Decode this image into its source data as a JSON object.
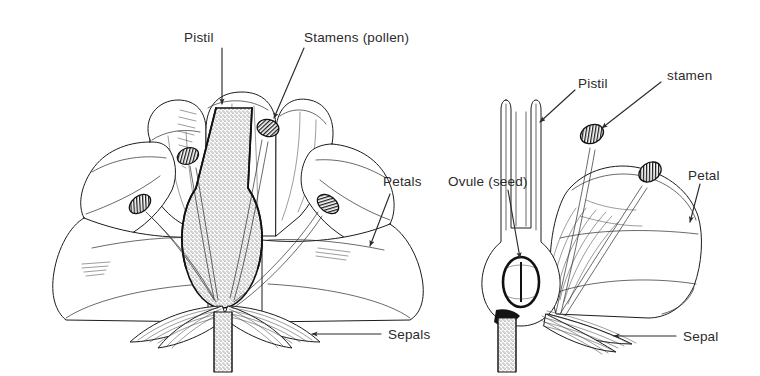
{
  "figure": {
    "background_color": "#ffffff",
    "ink_color": "#1c1c1c",
    "text_color": "#2b2b2b",
    "width": 760,
    "height": 376
  },
  "left_diagram": {
    "name": "whole-flower-cutaway",
    "description": "Front cutaway view of a flower showing pistil, four stamens, spreading petals and sepals",
    "labels": [
      {
        "id": "pistil",
        "text": "Pistil",
        "x": 210,
        "y": 38,
        "leader": "vertical-arrow-down"
      },
      {
        "id": "stamens",
        "text": "Stamens (pollen)",
        "x": 303,
        "y": 38,
        "leader": "diagonal-arrow-down-left"
      },
      {
        "id": "petals",
        "text": "Petals",
        "x": 383,
        "y": 186,
        "leader": "diagonal-arrow-down-left"
      },
      {
        "id": "sepals",
        "text": "Sepals",
        "x": 388,
        "y": 336,
        "leader": "horizontal-arrow-left"
      }
    ],
    "parts": {
      "stamen_count": 4,
      "petal_count": 5,
      "sepal_count": 4,
      "pistil_style": "stippled column with swollen ovary base"
    }
  },
  "right_diagram": {
    "name": "flower-half-section",
    "description": "Cut-away half section of a flower showing the hollow pistil with ovule, two stamens, one petal and sepals",
    "labels": [
      {
        "id": "pistil",
        "text": "Pistil",
        "x": 578,
        "y": 84,
        "leader": "diagonal-arrow-down-left"
      },
      {
        "id": "stamen",
        "text": "stamen",
        "x": 667,
        "y": 84,
        "leader": "diagonal-arrow-down-left"
      },
      {
        "id": "ovule",
        "text": "Ovule (seed)",
        "x": 448,
        "y": 182,
        "leader": "diagonal-arrow-down-right"
      },
      {
        "id": "petal",
        "text": "Petal",
        "x": 693,
        "y": 176,
        "leader": "diagonal-arrow-down-left"
      },
      {
        "id": "sepal",
        "text": "Sepal",
        "x": 683,
        "y": 338,
        "leader": "horizontal-arrow-left"
      }
    ],
    "parts": {
      "stamen_count": 2,
      "petal_count": 1,
      "sepal_count": 1,
      "ovule_shape": "oval with central vertical line"
    }
  }
}
